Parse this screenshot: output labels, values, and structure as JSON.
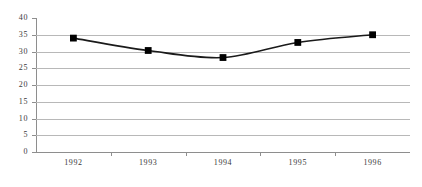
{
  "chart_data": {
    "type": "line",
    "title": "",
    "subtitle": "",
    "xlabel": "",
    "ylabel": "",
    "categories": [
      "1992",
      "1993",
      "1994",
      "1995",
      "1996"
    ],
    "values": [
      34.0,
      30.3,
      28.2,
      32.7,
      35.0
    ],
    "series": [
      {
        "name": "",
        "values": [
          34.0,
          30.3,
          28.2,
          32.7,
          35.0
        ],
        "line_color": "#1a1a1a",
        "marker": "square",
        "marker_color": "#000000"
      }
    ],
    "ylim": [
      0,
      40
    ],
    "ytick_values": [
      0,
      5,
      10,
      15,
      20,
      25,
      30,
      35,
      40
    ],
    "ytick_labels": [
      "0",
      "5",
      "10",
      "15",
      "20",
      "25",
      "30",
      "35",
      "40"
    ],
    "xtick_labels": [
      "1992",
      "1993",
      "1994",
      "1995",
      "1996"
    ],
    "grid": "horizontal",
    "grid_color": "#b8b8b8",
    "axis_color": "#8e8e8e",
    "legend": "none",
    "legend_position": "none",
    "background_color": "#ffffff",
    "annotations": []
  }
}
